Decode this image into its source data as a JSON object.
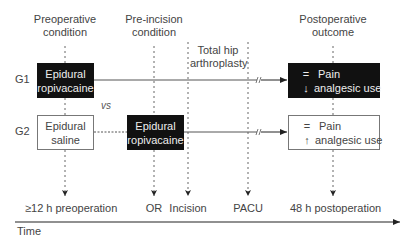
{
  "columns": [
    {
      "id": "preoperative",
      "label_line1": "Preoperative",
      "label_line2": "condition"
    },
    {
      "id": "pre_incision",
      "label_line1": "Pre-incision",
      "label_line2": "condition"
    },
    {
      "id": "surgery",
      "label_line1": "Total hip",
      "label_line2": "arthroplasty"
    },
    {
      "id": "postoperative",
      "label_line1": "Postoperative",
      "label_line2": "outcome"
    }
  ],
  "groups": [
    {
      "label": "G1",
      "preoperative": {
        "line1": "Epidural",
        "line2": "ropivacaine",
        "style": "dark"
      },
      "outcome": {
        "pain_symbol": "=",
        "pain_label": "Pain",
        "analgesic_symbol": "↓",
        "analgesic_label": "analgesic use",
        "style": "dark"
      }
    },
    {
      "label": "G2",
      "preoperative": {
        "line1": "Epidural",
        "line2": "saline",
        "style": "light"
      },
      "pre_incision": {
        "line1": "Epidural",
        "line2": "ropivacaine",
        "style": "dark"
      },
      "outcome": {
        "pain_symbol": "=",
        "pain_label": "Pain",
        "analgesic_symbol": "↑",
        "analgesic_label": "analgesic use",
        "style": "light"
      }
    }
  ],
  "comparison_label": "vs",
  "timeline": {
    "axis_label": "Time",
    "points": [
      {
        "label": "≥12 h preoperation"
      },
      {
        "label": "OR"
      },
      {
        "label": "Incision"
      },
      {
        "label": "PACU"
      },
      {
        "label": "48 h postoperation"
      }
    ]
  }
}
